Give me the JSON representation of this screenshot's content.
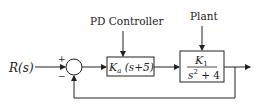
{
  "diagram": {
    "type": "feedback-control-block-diagram",
    "input_label": "R(s)",
    "summing_junction": {
      "plus_sign": "+",
      "minus_sign": "−"
    },
    "controller": {
      "title": "PD Controller",
      "gain_symbol": "K",
      "gain_subscript": "a",
      "expr": " (s+5)"
    },
    "plant": {
      "title": "Plant",
      "numerator_symbol": "K",
      "numerator_subscript": "1",
      "denominator_base": "s",
      "denominator_exp": "2",
      "denominator_rest": " + 4"
    },
    "colors": {
      "line": "#222222",
      "background": "#ffffff"
    }
  }
}
